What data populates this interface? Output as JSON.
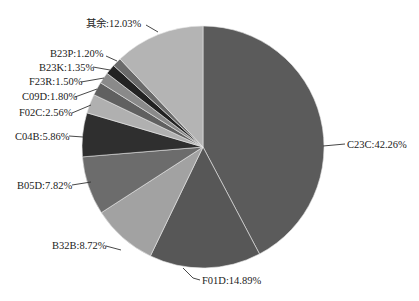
{
  "chart_data": {
    "type": "pie",
    "title": "",
    "start_angle_deg": 0,
    "direction": "clockwise",
    "slices": [
      {
        "label": "C23C",
        "value": 42.26,
        "text": "C23C:42.26%",
        "color": "#5b5b5b"
      },
      {
        "label": "F01D",
        "value": 14.89,
        "text": "F01D:14.89%",
        "color": "#575757"
      },
      {
        "label": "B32B",
        "value": 8.72,
        "text": "B32B:8.72%",
        "color": "#a2a2a2"
      },
      {
        "label": "B05D",
        "value": 7.82,
        "text": "B05D:7.82%",
        "color": "#6c6c6c"
      },
      {
        "label": "C04B",
        "value": 5.86,
        "text": "C04B:5.86%",
        "color": "#2f2f2f"
      },
      {
        "label": "F02C",
        "value": 2.56,
        "text": "F02C:2.56%",
        "color": "#b0b0b0"
      },
      {
        "label": "C09D",
        "value": 1.8,
        "text": "C09D:1.80%",
        "color": "#606060"
      },
      {
        "label": "F23R",
        "value": 1.5,
        "text": "F23R:1.50%",
        "color": "#8a8a8a"
      },
      {
        "label": "B23K",
        "value": 1.35,
        "text": "B23K:1.35%",
        "color": "#222222"
      },
      {
        "label": "B23P",
        "value": 1.2,
        "text": "B23P:1.20%",
        "color": "#6a6a6a"
      },
      {
        "label": "其余",
        "value": 12.03,
        "text": "其余:12.03%",
        "color": "#b4b4b4"
      }
    ],
    "legend": "none",
    "labels": "outside with leader lines"
  },
  "labels": {
    "c23c": "C23C:42.26%",
    "f01d": "F01D:14.89%",
    "b32b": "B32B:8.72%",
    "b05d": "B05D:7.82%",
    "c04b": "C04B:5.86%",
    "f02c": "F02C:2.56%",
    "c09d": "C09D:1.80%",
    "f23r": "F23R:1.50%",
    "b23k": "B23K:1.35%",
    "b23p": "B23P:1.20%",
    "other": "其余:12.03%"
  }
}
